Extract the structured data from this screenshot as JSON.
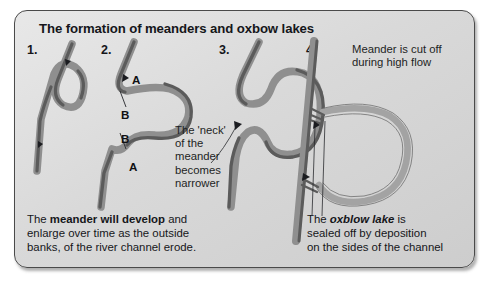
{
  "figure": {
    "title": "The formation of meanders and oxbow lakes",
    "background_color": "#d9d9d9",
    "border_color": "#4a4a4a",
    "channel_color": "#8f8f8f",
    "erosion_bank_color": "#5b5b5b",
    "lake_color": "#a3a3a3"
  },
  "stages": [
    {
      "number": "1.",
      "caption_ref": "caption_left"
    },
    {
      "number": "2.",
      "caption_ref": "caption_left"
    },
    {
      "number": "3.",
      "caption_ref": "note_neck"
    },
    {
      "number": "4.",
      "caption_ref": "caption_right"
    }
  ],
  "labels": {
    "stage2_a_top": "A",
    "stage2_b_top": "B",
    "stage2_b_bottom": "B",
    "stage2_a_bottom": "A"
  },
  "notes": {
    "neck": {
      "line1": "The 'neck'",
      "line2": "of the",
      "line3": "meander",
      "line4": "becomes",
      "line5": "narrower"
    },
    "cutoff": {
      "line1": "Meander is cut off",
      "line2": "during high flow"
    }
  },
  "captions": {
    "left": {
      "part1": "The ",
      "bold": "meander will develop",
      "part2": " and",
      "line2": "enlarge over time as the outside",
      "line3": "banks, of the river channel erode."
    },
    "right": {
      "part1": "The ",
      "bold_italic": "oxblow lake",
      "part2": " is",
      "line2": "sealed off by deposition",
      "line3": "on the sides of the channel"
    }
  }
}
